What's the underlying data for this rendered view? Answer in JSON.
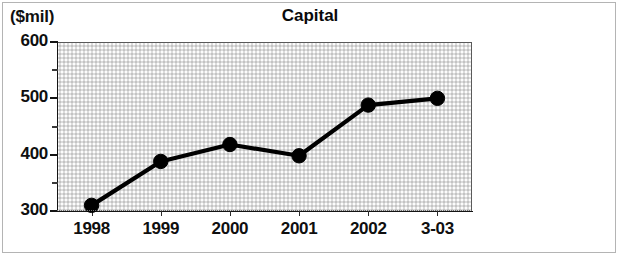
{
  "figure": {
    "unit_label": "($mil)",
    "title": "Capital"
  },
  "chart_data": {
    "type": "line",
    "title": "Capital",
    "subtitle": "",
    "xlabel": "",
    "ylabel": "($mil)",
    "categories": [
      "1998",
      "1999",
      "2000",
      "2001",
      "2002",
      "3-03"
    ],
    "values": [
      310,
      388,
      418,
      398,
      488,
      500
    ],
    "series": [
      {
        "name": "Capital",
        "values": [
          310,
          388,
          418,
          398,
          488,
          500
        ]
      }
    ],
    "ylim": [
      300,
      600
    ],
    "ytick_labels": [
      "600",
      "500",
      "400",
      "300"
    ],
    "ytick_values": [
      600,
      500,
      400,
      300
    ],
    "yminor_values": [
      550,
      450,
      350
    ],
    "xtick_labels": [
      "1998",
      "1999",
      "2000",
      "2001",
      "2002",
      "3-03"
    ],
    "grid": false,
    "legend": "none",
    "marker": "filled-circle",
    "line_color": "#000000",
    "plot_background": "#dcdcdc"
  }
}
